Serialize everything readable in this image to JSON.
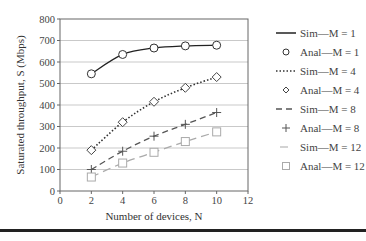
{
  "chart_data": {
    "type": "line",
    "title": "",
    "xlabel": "Number of devices, N",
    "ylabel": "Saturated throughput, S (Mbps)",
    "xlim": [
      0,
      12
    ],
    "ylim": [
      0,
      800
    ],
    "xticks": [
      0,
      2,
      4,
      6,
      8,
      10,
      12
    ],
    "yticks": [
      0,
      100,
      200,
      300,
      400,
      500,
      600,
      700,
      800
    ],
    "grid": "horizontal",
    "legend_position": "right",
    "x": [
      2,
      4,
      6,
      8,
      10
    ],
    "series": [
      {
        "name": "Sim—M = 1",
        "kind": "line",
        "style": "solid",
        "color": "#222222",
        "values": [
          545,
          635,
          665,
          675,
          678
        ]
      },
      {
        "name": "Anal—M = 1",
        "kind": "marker",
        "marker": "circle",
        "color": "#333333",
        "values": [
          545,
          635,
          665,
          675,
          678
        ]
      },
      {
        "name": "Sim—M = 4",
        "kind": "line",
        "style": "dotted",
        "color": "#333333",
        "values": [
          190,
          320,
          415,
          480,
          530
        ]
      },
      {
        "name": "Anal—M = 4",
        "kind": "marker",
        "marker": "diamond",
        "color": "#444444",
        "values": [
          190,
          320,
          415,
          480,
          530
        ]
      },
      {
        "name": "Sim—M = 8",
        "kind": "line",
        "style": "dashed",
        "color": "#555555",
        "values": [
          100,
          185,
          255,
          310,
          365
        ]
      },
      {
        "name": "Anal—M = 8",
        "kind": "marker",
        "marker": "plus",
        "color": "#555555",
        "values": [
          100,
          185,
          255,
          310,
          365
        ]
      },
      {
        "name": "Sim—M = 12",
        "kind": "line",
        "style": "dashed",
        "color": "#aaaaaa",
        "values": [
          65,
          130,
          180,
          230,
          275
        ]
      },
      {
        "name": "Anal—M = 12",
        "kind": "marker",
        "marker": "square",
        "color": "#aaaaaa",
        "values": [
          65,
          130,
          180,
          230,
          275
        ]
      }
    ]
  },
  "legend": [
    {
      "label": "Sim—M = 1"
    },
    {
      "label": "Anal—M = 1"
    },
    {
      "label": "Sim—M = 4"
    },
    {
      "label": "Anal—M = 4"
    },
    {
      "label": "Sim—M = 8"
    },
    {
      "label": "Anal—M = 8"
    },
    {
      "label": "Sim—M = 12"
    },
    {
      "label": "Anal—M = 12"
    }
  ]
}
